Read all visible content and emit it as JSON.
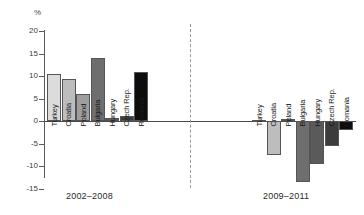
{
  "chart_data": {
    "type": "bar",
    "title": "",
    "subtitle": "",
    "xlabel": "",
    "ylabel": "%",
    "ylim": [
      -15,
      20
    ],
    "ytick_values": [
      20,
      15,
      10,
      5,
      0,
      -5,
      -10,
      -15
    ],
    "ytick_labels": [
      "20",
      "15",
      "10",
      "5",
      "0",
      "-5",
      "-10",
      "-15"
    ],
    "grid": false,
    "legend": "none",
    "categories": [
      "Turkey",
      "Croatia",
      "Poland",
      "Bulgaria",
      "Hungary",
      "Czech Rep.",
      "Romania"
    ],
    "groups": [
      {
        "name": "2002-2008",
        "label": "2002–2008",
        "values": [
          10.5,
          9.4,
          6.0,
          14.0,
          0.6,
          1.2,
          11.0
        ]
      },
      {
        "name": "2009-2011",
        "label": "2009–2011",
        "values": [
          0.2,
          -7.5,
          0.4,
          -13.5,
          -9.5,
          -5.5,
          -2.0
        ]
      }
    ],
    "bar_colors": [
      "#dcdcdc",
      "#bdbdbd",
      "#9e9e9e",
      "#6e6e6e",
      "#5a5a5a",
      "#3c3c3c",
      "#0d0d0d"
    ],
    "divider": "dashed-vertical"
  },
  "axis": {
    "unit_label": "%"
  }
}
